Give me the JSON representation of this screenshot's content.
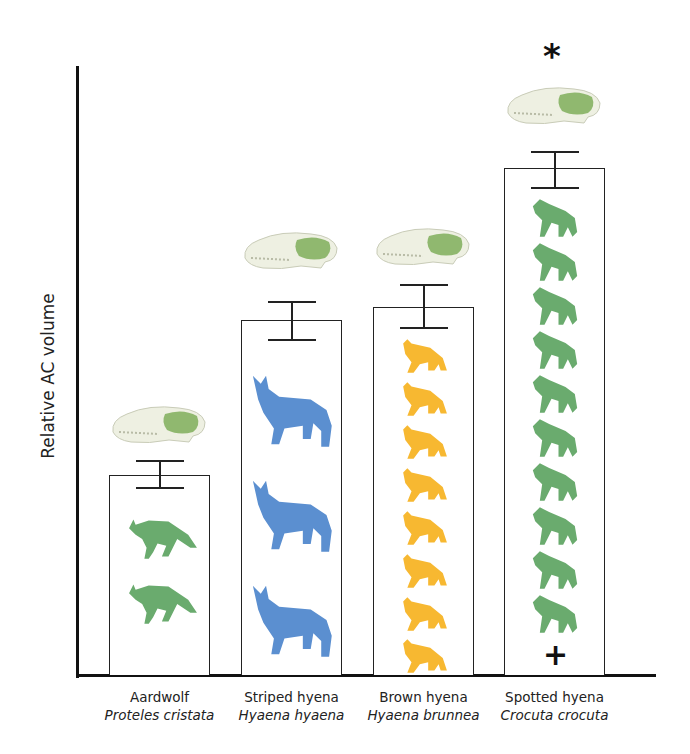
{
  "chart_data": {
    "type": "bar",
    "title": "",
    "xlabel": "",
    "ylabel": "Relative AC volume",
    "categories": [
      "Aardwolf",
      "Striped hyena",
      "Brown hyena",
      "Spotted hyena"
    ],
    "scientific_names": [
      "Proteles cristata",
      "Hyaena hyaena",
      "Hyaena brunnea",
      "Crocuta crocuta"
    ],
    "values": [
      200,
      355,
      368,
      507
    ],
    "error_bars": [
      {
        "low": 187,
        "high": 214
      },
      {
        "low": 335,
        "high": 373
      },
      {
        "low": 347,
        "high": 390
      },
      {
        "low": 487,
        "high": 523
      }
    ],
    "ylim": [
      0,
      610
    ],
    "grid": false,
    "ticks_shown": false,
    "icon_counts": [
      2,
      3,
      8,
      10
    ],
    "icon_colors": [
      "#6aab6e",
      "#5b8fd0",
      "#f7b831",
      "#6aab6e"
    ],
    "annotations": [
      {
        "text": "*",
        "position": "above Spotted hyena skull"
      },
      {
        "text": "+",
        "position": "bottom of Spotted hyena bar"
      }
    ],
    "skull_images": [
      "aardwolf-skull",
      "striped-hyena-skull",
      "brown-hyena-skull",
      "spotted-hyena-skull"
    ]
  }
}
